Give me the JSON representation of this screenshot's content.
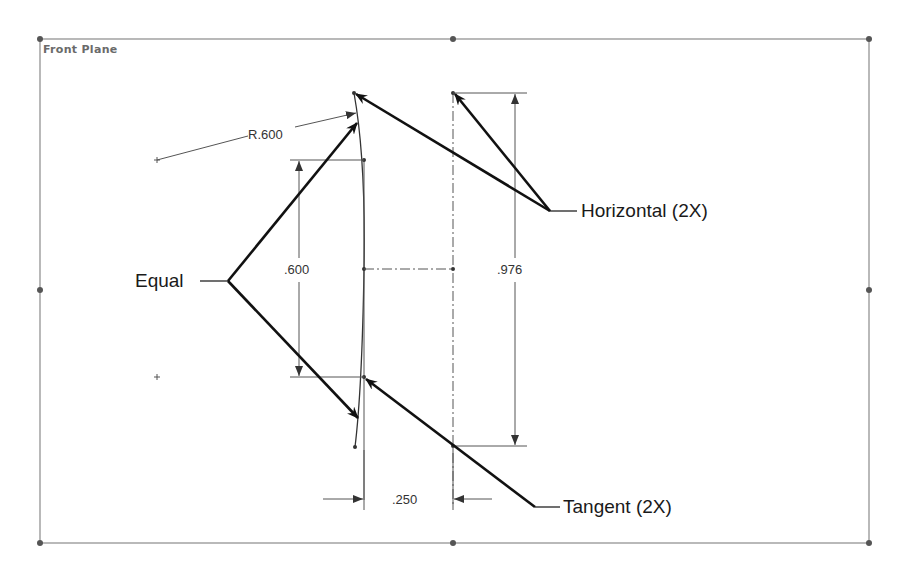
{
  "sketch": {
    "plane_label": "Front Plane",
    "colors": {
      "background": "#ffffff",
      "frame": "#8a8a8a",
      "geometry": "#333333",
      "leader": "#111111",
      "text": "#1a1a1a"
    }
  },
  "dimensions": {
    "radius": "R.600",
    "height_left": ".600",
    "height_right": ".976",
    "width_bottom": ".250"
  },
  "callouts": {
    "equal": "Equal",
    "horizontal": "Horizontal (2X)",
    "tangent": "Tangent (2X)"
  }
}
